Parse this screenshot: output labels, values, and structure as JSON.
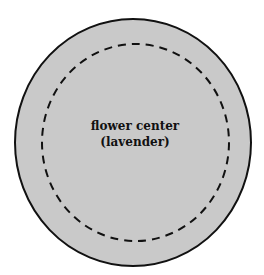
{
  "diagram": {
    "outer_circle": {
      "fill": "#c9c9c9",
      "stroke": "#111111",
      "style": "solid"
    },
    "inner_circle": {
      "stroke": "#111111",
      "style": "dashed"
    },
    "label": {
      "line1": "flower center",
      "line2": "(lavender)"
    }
  }
}
